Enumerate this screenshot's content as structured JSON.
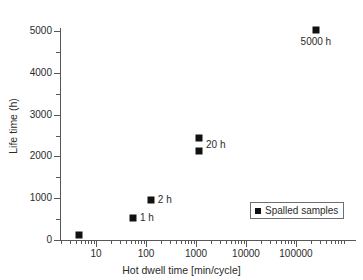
{
  "chart_data": {
    "type": "scatter",
    "title": "",
    "xlabel": "Hot dwell time [min/cycle]",
    "ylabel": "Life time (h)",
    "xscale": "log",
    "yscale": "linear",
    "xlim": [
      3,
      600000
    ],
    "ylim": [
      0,
      5300
    ],
    "grid": false,
    "legend_position": "lower right",
    "xtick_labels": [
      "10",
      "100",
      "1000",
      "10000",
      "100000"
    ],
    "xtick_values": [
      10,
      100,
      1000,
      10000,
      100000
    ],
    "ytick_labels": [
      "0",
      "1000",
      "2000",
      "3000",
      "4000",
      "5000"
    ],
    "ytick_values": [
      0,
      1000,
      2000,
      3000,
      4000,
      5000
    ],
    "ytick_minor_values": [
      500,
      1500,
      2500,
      3500,
      4500
    ],
    "series": [
      {
        "name": "Spalled samples",
        "marker": "filled-square",
        "color": "#111111",
        "points": [
          {
            "x": 4.5,
            "y": 120,
            "label": ""
          },
          {
            "x": 55,
            "y": 520,
            "label": "1 h"
          },
          {
            "x": 125,
            "y": 960,
            "label": "2 h"
          },
          {
            "x": 1150,
            "y": 2430,
            "label": "20 h"
          },
          {
            "x": 1150,
            "y": 2130,
            "label": ""
          },
          {
            "x": 250000,
            "y": 5030,
            "label": "5000 h"
          }
        ]
      }
    ],
    "annotations": [
      {
        "text": "1 h",
        "x": 55,
        "y": 520,
        "placement": "right"
      },
      {
        "text": "2 h",
        "x": 125,
        "y": 960,
        "placement": "right"
      },
      {
        "text": "20 h",
        "x": 1150,
        "y": 2280,
        "placement": "right"
      },
      {
        "text": "5000 h",
        "x": 250000,
        "y": 5030,
        "placement": "below"
      }
    ],
    "legend_entries": [
      {
        "label": "Spalled samples",
        "marker": "filled-square",
        "color": "#111111"
      }
    ]
  },
  "axes": {
    "x_title": "Hot dwell time [min/cycle]",
    "y_title": "Life time (h)"
  },
  "xticks": [
    {
      "label": "10"
    },
    {
      "label": "100"
    },
    {
      "label": "1000"
    },
    {
      "label": "10000"
    },
    {
      "label": "100000"
    }
  ],
  "yticks": [
    {
      "label": "0"
    },
    {
      "label": "1000"
    },
    {
      "label": "2000"
    },
    {
      "label": "3000"
    },
    {
      "label": "4000"
    },
    {
      "label": "5000"
    }
  ],
  "markers": [
    {
      "label": ""
    },
    {
      "label": "1 h"
    },
    {
      "label": "2 h"
    },
    {
      "label": "20 h"
    },
    {
      "label": ""
    },
    {
      "label": "5000 h"
    }
  ],
  "legend": {
    "label": "Spalled samples"
  }
}
